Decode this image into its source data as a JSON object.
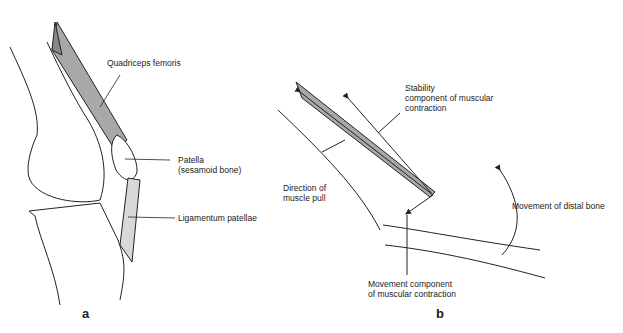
{
  "figure": {
    "panel_a": {
      "letter": "a",
      "labels": {
        "quadriceps": "Quadriceps femoris",
        "patella_1": "Patella",
        "patella_2": "(sesamoid bone)",
        "ligamentum": "Ligamentum patellae"
      }
    },
    "panel_b": {
      "letter": "b",
      "labels": {
        "stability_1": "Stability",
        "stability_2": "component of muscular",
        "stability_3": "contraction",
        "direction_1": "Direction of",
        "direction_2": "muscle pull",
        "distal": "Movement of distal bone",
        "movement_1": "Movement component",
        "movement_2": "of muscular contraction"
      }
    },
    "colors": {
      "line": "#222222",
      "muscle_fill": "#a8a8a8",
      "tendon_fill": "#d8d8d8"
    }
  }
}
